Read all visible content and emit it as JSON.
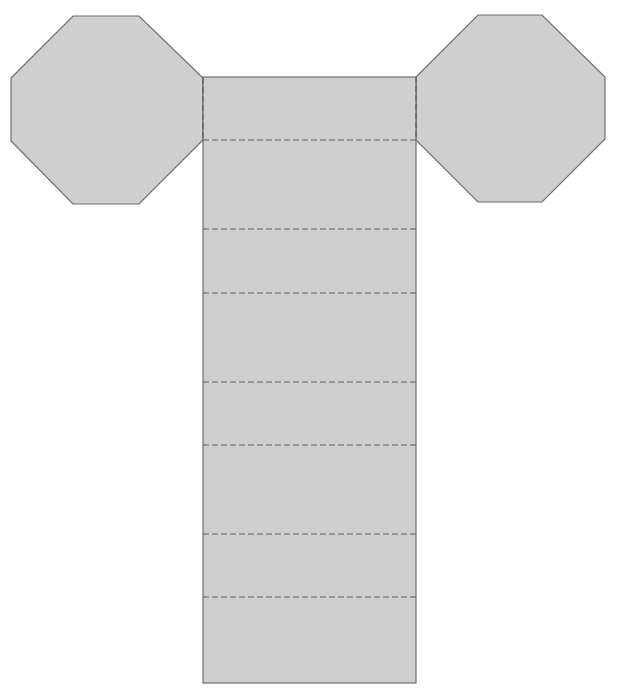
{
  "diagram": {
    "type": "net",
    "shape": "octagonal prism net",
    "colors": {
      "face_fill": "#cfcfcf",
      "edge_stroke": "#6e6e6e",
      "fold_stroke": "#5f5f5f",
      "background": "#ffffff"
    },
    "octagons": [
      {
        "name": "left-base-octagon",
        "points": [
          [
            73,
            16
          ],
          [
            139,
            16
          ],
          [
            203,
            78
          ],
          [
            203,
            140
          ],
          [
            139,
            204
          ],
          [
            73,
            204
          ],
          [
            11,
            141
          ],
          [
            11,
            78
          ]
        ]
      },
      {
        "name": "right-base-octagon",
        "points": [
          [
            478,
            15
          ],
          [
            542,
            15
          ],
          [
            605,
            77
          ],
          [
            605,
            139
          ],
          [
            542,
            202
          ],
          [
            478,
            202
          ],
          [
            416,
            140
          ],
          [
            416,
            77
          ]
        ]
      }
    ],
    "lateral_strip": {
      "x": 203,
      "y": 77,
      "width": 213,
      "height": 606
    },
    "fold_lines": {
      "vertical": [
        {
          "name": "left-octagon-fold",
          "x": 203,
          "y1": 78,
          "y2": 140
        },
        {
          "name": "right-octagon-fold",
          "x": 416,
          "y1": 77,
          "y2": 140
        }
      ],
      "horizontal_y": [
        140,
        229,
        293,
        382,
        445,
        534,
        597
      ]
    }
  }
}
